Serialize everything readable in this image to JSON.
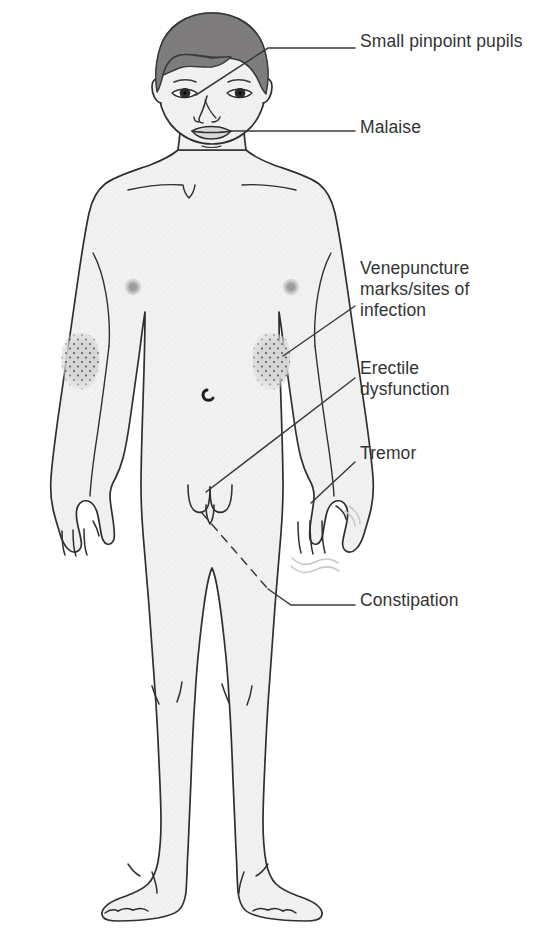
{
  "diagram": {
    "colors": {
      "skin_fill": "#f0f0f0",
      "outline": "#2f2f2f",
      "hair": "#7e7c7c",
      "nipple": "#9a9a9a",
      "mark_patch": "#d2d2d2",
      "stipple": "#4a4a4a",
      "tremor_shadow": "#cfcfcf",
      "label_text": "#333333",
      "leader_line": "#3a3a3a",
      "background": "#ffffff"
    },
    "labels": [
      {
        "id": "pupils",
        "text": "Small pinpoint pupils",
        "target": "eyes",
        "leader": "solid"
      },
      {
        "id": "malaise",
        "text": "Malaise",
        "target": "face/mouth",
        "leader": "solid"
      },
      {
        "id": "venepuncture",
        "text": "Venepuncture\nmarks/sites of\ninfection",
        "target": "antecubital-fossa",
        "leader": "solid"
      },
      {
        "id": "erectile",
        "text": "Erectile\ndysfunction",
        "target": "genitals",
        "leader": "solid"
      },
      {
        "id": "tremor",
        "text": "Tremor",
        "target": "right-hand",
        "leader": "solid"
      },
      {
        "id": "constipation",
        "text": "Constipation",
        "target": "lower-abdomen",
        "leader": "dashed"
      }
    ],
    "body_features": [
      "dark gray short hair",
      "pinpoint pupils",
      "nipples",
      "umbilicus",
      "venepuncture marks at both antecubital fossae",
      "tremor motion lines at right hand",
      "knee creases",
      "bare feet with toes"
    ]
  }
}
